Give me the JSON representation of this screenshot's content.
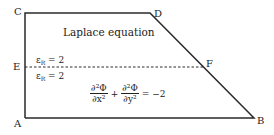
{
  "vertices": {
    "A": "A",
    "B": "B",
    "C": "C",
    "D": "D",
    "E": "E",
    "F": "F"
  },
  "regions": {
    "upper": {
      "title": "Laplace equation",
      "permittivity": {
        "symbol": "ε",
        "subscript": "R",
        "value": "= 2"
      }
    },
    "lower": {
      "permittivity": {
        "symbol": "ε",
        "subscript": "R",
        "value": "= 2"
      },
      "equation": {
        "term1_num": "∂²Φ",
        "term1_den": "∂x²",
        "plus": "+",
        "term2_num": "∂²Φ",
        "term2_den": "∂y²",
        "rhs": "= −2"
      }
    }
  },
  "colors": {
    "stroke": "#2a2a2a",
    "text": "#222222"
  }
}
